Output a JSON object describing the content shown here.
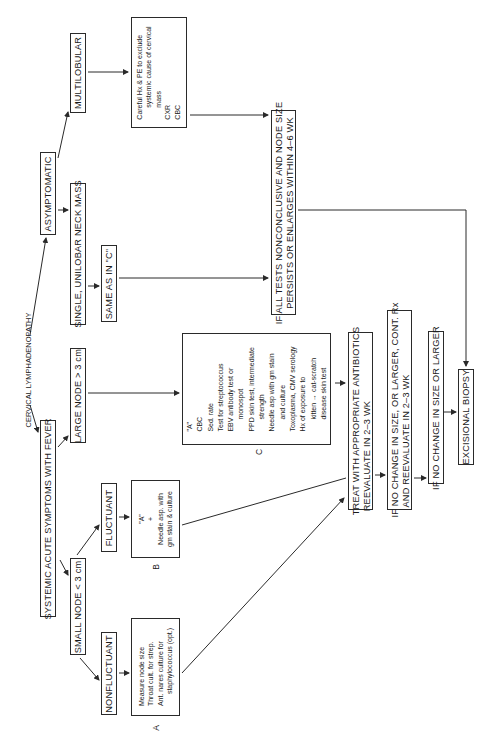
{
  "title": "CERVICAL LYMPHADENOPATHY",
  "nodes": {
    "asymptomatic": "ASYMPTOMATIC",
    "systemic": "SYSTEMIC ACUTE SYMPTOMS WITH FEVER",
    "multilobular": "MULTILOBULAR",
    "single_unilobar": "SINGLE, UNILOBAR NECK MASS",
    "large_node": "LARGE NODE > 3 cm",
    "small_node": "SMALL NODE < 3 cm",
    "same_as_c": "SAME AS IN \"C\"",
    "fluctuant": "FLUCTUANT",
    "nonfluctuant": "NONFLUCTUANT",
    "if_all_tests_line1": "IF ALL TESTS NONCONCLUSIVE AND NODE SIZE",
    "if_all_tests_line2": "PERSISTS OR ENLARGES WITHIN 4–6 WK",
    "treat_line1": "TREAT WITH APPROPRIATE ANTIBIOTICS",
    "treat_line2": "REEVALUATE IN 2–3 WK",
    "no_change_cont_line1": "IF NO CHANGE IN SIZE, OR LARGER, CONT. Rx",
    "no_change_cont_line2": "AND REEVALUATE IN 2–3 WK",
    "no_change_larger": "IF NO CHANGE IN SIZE OR LARGER",
    "excisional_biopsy": "EXCISIONAL BIOPSY"
  },
  "boxes": {
    "multilobular_workup": {
      "lines": [
        "Careful Hx & PE to exclude",
        "systemic cause of cervical",
        "mass",
        "CXR",
        "CBC"
      ]
    },
    "box_c": {
      "label": "C",
      "lines": [
        "\"A\"",
        "CBC",
        "Sed. rate",
        "Test for streptococcus",
        "EBV antibody test or",
        "monospot",
        "PPD skin test, intermediate",
        "strength",
        "Needle asp with gm stain",
        "and culture",
        "Toxoplasma, CMV serology",
        "Hx of exposure to",
        "kitten → cat-scratch",
        "disease skin test"
      ]
    },
    "box_b": {
      "label": "B",
      "lines": [
        "\"A\"",
        "+",
        "Needle asp. with",
        "gm stain & culture"
      ]
    },
    "box_a": {
      "label": "A",
      "lines": [
        "Measure node size",
        "Throat cult. for strep.",
        "Ant. nares culture for",
        "staphylococcus (opt.)"
      ]
    }
  }
}
